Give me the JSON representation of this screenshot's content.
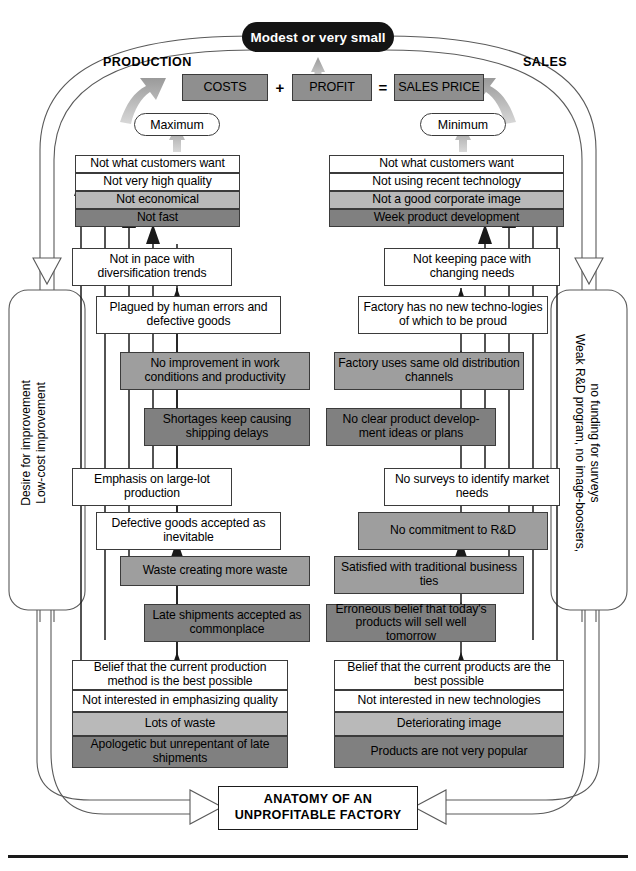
{
  "title_capsule": "Modest or very small",
  "headers": {
    "left": "PRODUCTION",
    "right": "SALES"
  },
  "equation": {
    "costs": "COSTS",
    "plus": "+",
    "profit": "PROFIT",
    "equals": "=",
    "sales_price": "SALES PRICE"
  },
  "capsules": {
    "left": "Maximum",
    "right": "Minimum"
  },
  "production_stack": [
    "Not what customers want",
    "Not very high quality",
    "Not economical",
    "Not fast"
  ],
  "sales_stack": [
    "Not what customers want",
    "Not using recent technology",
    "Not a good corporate image",
    "Week product development"
  ],
  "production_cascade": [
    "Not in pace with diversification trends",
    "Plagued by human errors and defective goods",
    "No improvement in work conditions and productivity",
    "Shortages keep causing shipping delays"
  ],
  "sales_cascade": [
    "Not keeping pace with changing needs",
    "Factory has no new techno-logies of which to be proud",
    "Factory uses same old distribution channels",
    "No clear product develop-ment ideas or plans"
  ],
  "production_cascade2": [
    "Emphasis on large-lot production",
    "Defective goods accepted as inevitable",
    "Waste creating more waste",
    "Late shipments accepted as commonplace"
  ],
  "sales_cascade2": [
    "No surveys to identify market needs",
    "No commitment to R&D",
    "Satisfied with traditional business ties",
    "Erroneous belief that today's products will sell well tomorrow"
  ],
  "production_base": [
    "Belief that the current production method is the best possible",
    "Not interested in emphasizing quality",
    "Lots of waste",
    "Apologetic but unrepentant of late shipments"
  ],
  "sales_base": [
    "Belief that the current products are the best possible",
    "Not interested in new technologies",
    "Deteriorating image",
    "Products are not very popular"
  ],
  "side_labels": {
    "left_line1": "Desire for improvement",
    "left_line2": "Low-cost improvement",
    "right_line1": "Weak R&D program, no image-boosters,",
    "right_line2": "no funding for surveys"
  },
  "anatomy": "ANATOMY OF AN UNPROFITABLE FACTORY",
  "colors": {
    "white": "#ffffff",
    "light_gray": "#b9b9b9",
    "mid_gray": "#9e9e9e",
    "dark_gray": "#808080",
    "black": "#141414",
    "outline": "#3b3b3b"
  }
}
